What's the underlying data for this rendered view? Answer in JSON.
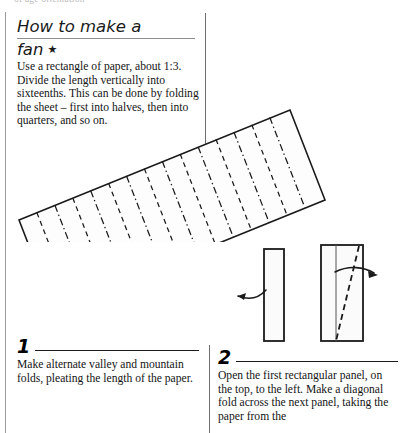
{
  "page": {
    "cut_off_top_text": "of age orientation",
    "background_color": "#ffffff",
    "ink_color": "#1a1a1a"
  },
  "header": {
    "title_line1": "How to make a",
    "title_line2": "fan",
    "difficulty_star": "★"
  },
  "intro": {
    "text": "Use a rectangle of paper, about 1:3. Divide the length vertically into sixteenths. This can be done by folding the sheet – first into halves, then into quarters, and so on."
  },
  "steps": [
    {
      "number": "1",
      "text": "Make alternate valley and mountain folds, pleating the length of the paper."
    },
    {
      "number": "2",
      "text": "Open the first rectangular panel, on the top, to the left. Make a diagonal fold across the next panel, taking the paper from the"
    }
  ],
  "figures": {
    "fan": {
      "name": "pleated-rectangle-diagram",
      "description": "Rotated rectangle of paper divided into sixteenths with alternating valley (dashed) and mountain (dash-dot) fold lines",
      "rotation_degrees": -22,
      "fold_count": 15,
      "outline_color": "#1a1a1a",
      "fill_color": "#fdfdfd",
      "valley_line_style": "dashed",
      "mountain_line_style": "dash-dot"
    },
    "step2": {
      "name": "two-panel-fold-diagram",
      "left_panel": {
        "description": "Narrow closed fan panel with curved arrow pointing left",
        "arrow_direction": "left",
        "fill_color": "#fbfbfb",
        "outline_color": "#1a1a1a"
      },
      "right_panel": {
        "description": "Wider panel showing vertical fold line and diagonal dashed fold with arrow pointing right",
        "arrow_direction": "right",
        "fill_color": "#fbfbfb",
        "outline_color": "#1a1a1a",
        "diagonal_line_style": "dashed"
      }
    }
  },
  "dividers": {
    "left_border": "vertical-rule",
    "column_divider": "vertical-rule",
    "step2_divider": "vertical-rule"
  }
}
